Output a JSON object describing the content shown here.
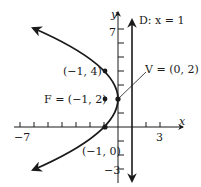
{
  "figure": {
    "type": "parabola",
    "equation_hint": "(y - 2)^2 = -4(x - 0)",
    "axes": {
      "x_label": "x",
      "y_label": "y",
      "x_tick_labels": {
        "min": "−7",
        "max": "3"
      },
      "y_tick_labels": {
        "max": "7",
        "min": "−3"
      },
      "x_range": [
        -7,
        3
      ],
      "y_range": [
        -3,
        7
      ]
    },
    "directrix": {
      "label": "D: x = 1",
      "x": 1
    },
    "vertex": {
      "label": "V = (0, 2)",
      "x": 0,
      "y": 2
    },
    "focus": {
      "label": "F = (−1, 2)",
      "x": -1,
      "y": 2
    },
    "points": [
      {
        "label": "(−1, 4)",
        "x": -1,
        "y": 4
      },
      {
        "label": "(−1, 0)",
        "x": -1,
        "y": 0
      }
    ],
    "colors": {
      "ink": "#1a1a1a",
      "background": "#ffffff"
    }
  }
}
